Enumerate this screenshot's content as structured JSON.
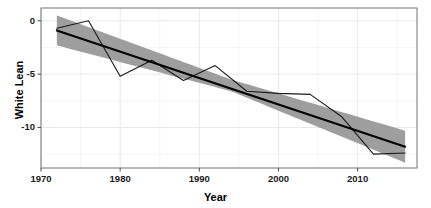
{
  "chart_data": {
    "type": "line",
    "title": "",
    "subtitle": "",
    "xlabel": "Year",
    "ylabel": "White Lean",
    "xlim": [
      1970,
      2017.5
    ],
    "ylim": [
      -13.8,
      1.2
    ],
    "grid": true,
    "legend": null,
    "x_ticks": [
      1970,
      1980,
      1990,
      2000,
      2010
    ],
    "x_tick_labels": [
      "1970",
      "1980",
      "1990",
      "2000",
      "2010"
    ],
    "y_ticks": [
      0,
      -5,
      -10
    ],
    "y_tick_labels": [
      "0",
      "-5",
      "-10"
    ],
    "series": [
      {
        "name": "observed-white-lean",
        "type": "line",
        "color": "#1a1a1a",
        "x": [
          1972,
          1976,
          1980,
          1984,
          1988,
          1992,
          1996,
          2000,
          2004,
          2008,
          2012,
          2016
        ],
        "values": [
          -0.7,
          0.0,
          -5.2,
          -3.7,
          -5.6,
          -4.2,
          -6.6,
          -6.8,
          -6.9,
          -9.0,
          -12.5,
          -12.4
        ]
      },
      {
        "name": "linear-trend-fit",
        "type": "line",
        "color": "#000000",
        "x": [
          1972,
          2016
        ],
        "values": [
          -0.9,
          -11.8
        ]
      },
      {
        "name": "confidence-ribbon",
        "type": "area",
        "color": "#999999",
        "x": [
          1972,
          1994,
          2016
        ],
        "upper": [
          0.5,
          -5.5,
          -10.3
        ],
        "lower": [
          -2.3,
          -6.6,
          -13.3
        ]
      }
    ]
  },
  "axes": {
    "y_title": "White Lean",
    "x_title": "Year"
  }
}
